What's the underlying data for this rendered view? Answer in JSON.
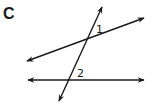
{
  "figure": {
    "panel_label": "C",
    "angle_labels": {
      "angle1": "1",
      "angle2": "2"
    },
    "line_color": "#1a1a1a",
    "lines": {
      "transversal": {
        "x1": 59,
        "y1": 101,
        "x2": 102,
        "y2": 7
      },
      "upper_line": {
        "x1": 27,
        "y1": 61,
        "x2": 144,
        "y2": 18
      },
      "lower_line": {
        "x1": 28,
        "y1": 80,
        "x2": 144,
        "y2": 80
      }
    }
  }
}
